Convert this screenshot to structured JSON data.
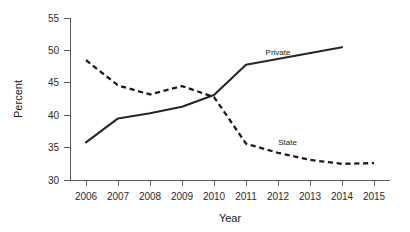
{
  "chart_data": {
    "type": "line",
    "title": "",
    "xlabel": "Year",
    "ylabel": "Percent",
    "xlim": [
      2005.5,
      2015.5
    ],
    "ylim": [
      30,
      55
    ],
    "grid": false,
    "legend": "inline-series-labels",
    "x": [
      2006,
      2007,
      2008,
      2009,
      2010,
      2011,
      2012,
      2013,
      2014,
      2015
    ],
    "xtick_labels": [
      "2006",
      "2007",
      "2008",
      "2009",
      "2010",
      "2011",
      "2012",
      "2013",
      "2014",
      "2015"
    ],
    "ytick_labels": [
      "30",
      "35",
      "40",
      "45",
      "50",
      "55"
    ],
    "yticks": [
      30,
      35,
      40,
      45,
      50,
      55
    ],
    "series": [
      {
        "name": "Private",
        "style": "solid",
        "color": "#262626",
        "label_x": 2012.0,
        "label_y": 49.3,
        "x": [
          2006,
          2007,
          2008,
          2009,
          2010,
          2011,
          2014
        ],
        "values": [
          35.8,
          39.5,
          40.3,
          41.3,
          43.1,
          47.8,
          50.5
        ]
      },
      {
        "name": "State",
        "style": "dashed",
        "color": "#1c1c1c",
        "label_x": 2012.3,
        "label_y": 35.4,
        "x": [
          2006,
          2007,
          2008,
          2009,
          2010,
          2011,
          2012,
          2013,
          2014,
          2015
        ],
        "values": [
          48.5,
          44.6,
          43.2,
          44.5,
          42.8,
          35.6,
          34.2,
          33.1,
          32.5,
          32.6
        ]
      }
    ],
    "annotations": [
      {
        "text": "Private",
        "x": 2012.0,
        "y": 49.3
      },
      {
        "text": "State",
        "x": 2012.3,
        "y": 35.4
      }
    ]
  }
}
